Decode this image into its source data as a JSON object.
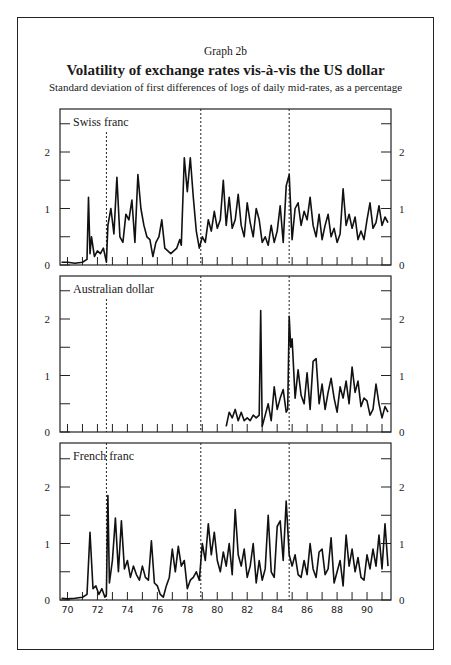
{
  "header": {
    "graph_label": "Graph 2b",
    "title": "Volatility of exchange rates vis-à-vis the US dollar",
    "subtitle": "Standard deviation of first differences of logs of daily mid-rates, as a percentage"
  },
  "colors": {
    "line": "#111111",
    "axis": "#222222",
    "background": "#ffffff"
  },
  "chart_data": {
    "type": "line",
    "title": "Volatility of exchange rates vis-à-vis the US dollar",
    "subtitle": "Standard deviation of first differences of logs of daily mid-rates, as a percentage",
    "xlabel": "",
    "ylabel": "",
    "x_ticks": [
      "70",
      "72",
      "74",
      "76",
      "78",
      "80",
      "82",
      "84",
      "86",
      "88",
      "90"
    ],
    "xlim": [
      69.5,
      91.6
    ],
    "ylim": [
      0,
      2.6
    ],
    "y_ticks": [
      0,
      1,
      2
    ],
    "y_minor_ticks": [
      0.5,
      1.5,
      2.5
    ],
    "grid": false,
    "vertical_reference_lines": [
      72.6,
      78.9,
      84.8
    ],
    "panels": [
      {
        "name": "Swiss franc",
        "x": [
          69.6,
          70.0,
          70.5,
          71.0,
          71.3,
          71.4,
          71.5,
          71.6,
          71.8,
          72.0,
          72.2,
          72.4,
          72.6,
          72.7,
          72.9,
          73.1,
          73.3,
          73.5,
          73.7,
          73.9,
          74.1,
          74.3,
          74.5,
          74.7,
          74.9,
          75.1,
          75.3,
          75.5,
          75.7,
          75.9,
          76.1,
          76.3,
          76.5,
          76.7,
          76.9,
          77.1,
          77.3,
          77.5,
          77.6,
          77.8,
          78.0,
          78.2,
          78.4,
          78.6,
          78.8,
          79.0,
          79.2,
          79.4,
          79.6,
          79.8,
          80.0,
          80.2,
          80.4,
          80.6,
          80.8,
          81.0,
          81.2,
          81.4,
          81.6,
          81.8,
          82.0,
          82.2,
          82.4,
          82.6,
          82.8,
          83.0,
          83.2,
          83.4,
          83.6,
          83.8,
          84.0,
          84.2,
          84.4,
          84.6,
          84.8,
          85.0,
          85.2,
          85.4,
          85.6,
          85.8,
          86.0,
          86.2,
          86.4,
          86.6,
          86.8,
          87.0,
          87.2,
          87.4,
          87.6,
          87.8,
          88.0,
          88.2,
          88.4,
          88.6,
          88.8,
          89.0,
          89.2,
          89.4,
          89.6,
          89.8,
          90.0,
          90.2,
          90.4,
          90.6,
          90.8,
          91.0,
          91.2,
          91.4
        ],
        "values": [
          0.05,
          0.05,
          0.03,
          0.05,
          0.1,
          1.2,
          0.2,
          0.5,
          0.15,
          0.25,
          0.2,
          0.3,
          0.05,
          0.7,
          1.0,
          0.55,
          1.55,
          0.5,
          0.4,
          0.9,
          0.8,
          1.15,
          0.4,
          1.6,
          1.0,
          0.7,
          0.5,
          0.45,
          0.15,
          0.4,
          0.5,
          0.8,
          0.3,
          0.25,
          0.2,
          0.25,
          0.3,
          0.45,
          0.35,
          1.9,
          1.3,
          1.9,
          1.2,
          0.6,
          0.3,
          0.5,
          0.4,
          0.8,
          0.6,
          0.95,
          0.65,
          0.8,
          1.5,
          0.7,
          1.2,
          0.65,
          0.8,
          1.25,
          0.7,
          0.5,
          1.1,
          0.75,
          0.5,
          1.0,
          0.8,
          0.4,
          0.5,
          0.35,
          0.7,
          0.4,
          0.6,
          1.05,
          0.4,
          1.4,
          1.6,
          0.45,
          1.0,
          1.1,
          0.7,
          0.95,
          0.8,
          1.2,
          0.7,
          0.5,
          0.9,
          0.45,
          0.7,
          0.9,
          0.5,
          0.65,
          0.4,
          0.55,
          1.35,
          0.7,
          0.9,
          0.65,
          0.85,
          0.45,
          0.6,
          0.45,
          0.8,
          1.1,
          0.65,
          0.75,
          1.05,
          0.7,
          0.85,
          0.75
        ]
      },
      {
        "name": "Australian dollar",
        "x": [
          80.6,
          80.8,
          81.0,
          81.2,
          81.4,
          81.6,
          81.8,
          82.0,
          82.2,
          82.4,
          82.6,
          82.8,
          82.9,
          83.0,
          83.2,
          83.4,
          83.6,
          83.8,
          84.0,
          84.2,
          84.4,
          84.6,
          84.7,
          84.8,
          84.9,
          85.0,
          85.2,
          85.4,
          85.6,
          85.8,
          86.0,
          86.2,
          86.4,
          86.6,
          86.8,
          87.0,
          87.2,
          87.4,
          87.6,
          87.8,
          88.0,
          88.2,
          88.4,
          88.6,
          88.8,
          89.0,
          89.2,
          89.4,
          89.6,
          89.8,
          90.0,
          90.2,
          90.4,
          90.6,
          90.8,
          91.0,
          91.2,
          91.4
        ],
        "values": [
          0.1,
          0.35,
          0.25,
          0.4,
          0.2,
          0.35,
          0.2,
          0.25,
          0.2,
          0.3,
          0.25,
          0.3,
          2.15,
          0.1,
          0.3,
          0.5,
          0.2,
          0.8,
          0.4,
          0.6,
          0.75,
          0.35,
          0.4,
          2.05,
          1.5,
          1.65,
          0.6,
          1.1,
          0.65,
          0.5,
          1.05,
          0.4,
          1.25,
          1.3,
          0.5,
          0.85,
          0.4,
          0.7,
          0.95,
          0.6,
          0.35,
          0.8,
          0.6,
          0.9,
          0.5,
          1.15,
          0.7,
          0.9,
          0.45,
          0.6,
          0.55,
          0.3,
          0.4,
          0.85,
          0.5,
          0.25,
          0.45,
          0.35
        ]
      },
      {
        "name": "French franc",
        "x": [
          69.6,
          70.0,
          70.5,
          71.0,
          71.3,
          71.5,
          71.7,
          71.9,
          72.1,
          72.3,
          72.5,
          72.6,
          72.7,
          72.8,
          73.0,
          73.2,
          73.4,
          73.6,
          73.8,
          74.0,
          74.2,
          74.4,
          74.6,
          74.8,
          75.0,
          75.2,
          75.4,
          75.6,
          75.8,
          76.0,
          76.2,
          76.4,
          76.6,
          76.8,
          77.0,
          77.2,
          77.4,
          77.6,
          77.8,
          78.0,
          78.2,
          78.4,
          78.6,
          78.8,
          79.0,
          79.2,
          79.4,
          79.6,
          79.8,
          80.0,
          80.2,
          80.4,
          80.6,
          80.8,
          81.0,
          81.2,
          81.4,
          81.6,
          81.8,
          82.0,
          82.2,
          82.4,
          82.6,
          82.8,
          83.0,
          83.2,
          83.4,
          83.6,
          83.8,
          84.0,
          84.2,
          84.4,
          84.6,
          84.8,
          85.0,
          85.2,
          85.4,
          85.6,
          85.8,
          86.0,
          86.2,
          86.4,
          86.6,
          86.8,
          87.0,
          87.2,
          87.4,
          87.6,
          87.8,
          88.0,
          88.2,
          88.4,
          88.6,
          88.8,
          89.0,
          89.2,
          89.4,
          89.6,
          89.8,
          90.0,
          90.2,
          90.4,
          90.6,
          90.8,
          91.0,
          91.2,
          91.4
        ],
        "values": [
          0.03,
          0.02,
          0.03,
          0.05,
          0.1,
          1.2,
          0.2,
          0.25,
          0.1,
          0.2,
          0.05,
          0.1,
          1.85,
          0.3,
          0.7,
          1.45,
          0.5,
          1.4,
          0.55,
          0.7,
          0.4,
          0.6,
          0.45,
          0.35,
          0.6,
          0.4,
          0.35,
          1.05,
          0.3,
          0.25,
          0.1,
          0.05,
          0.25,
          0.4,
          0.9,
          0.5,
          0.95,
          0.6,
          0.7,
          0.2,
          0.35,
          0.4,
          0.5,
          0.35,
          1.0,
          0.7,
          1.35,
          0.8,
          1.2,
          0.7,
          0.5,
          0.85,
          0.6,
          1.0,
          0.45,
          1.6,
          0.8,
          0.6,
          0.9,
          0.4,
          0.6,
          1.0,
          0.3,
          0.7,
          0.35,
          0.55,
          1.5,
          0.5,
          0.4,
          1.3,
          1.4,
          0.7,
          1.75,
          0.8,
          0.6,
          0.8,
          0.45,
          0.4,
          0.7,
          0.45,
          1.0,
          0.55,
          0.4,
          0.85,
          0.9,
          0.45,
          0.55,
          1.1,
          0.3,
          0.5,
          0.7,
          0.25,
          1.15,
          0.6,
          0.9,
          0.5,
          0.75,
          0.4,
          0.35,
          0.8,
          0.55,
          0.9,
          0.6,
          1.15,
          0.55,
          1.35,
          0.6
        ]
      }
    ]
  }
}
